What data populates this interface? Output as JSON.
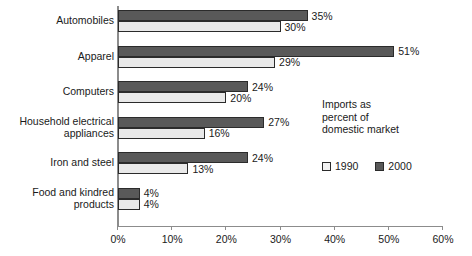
{
  "chart_data": {
    "type": "bar",
    "orientation": "horizontal",
    "title": "",
    "xlabel": "",
    "ylabel": "",
    "xlim": [
      0,
      60
    ],
    "xticks": [
      "0%",
      "10%",
      "20%",
      "30%",
      "40%",
      "50%",
      "60%"
    ],
    "xtick_values": [
      0,
      10,
      20,
      30,
      40,
      50,
      60
    ],
    "grid": false,
    "legend_position": "right-middle",
    "legend_title": "Imports as percent of domestic market",
    "legend_title_lines": [
      "Imports as",
      "percent of",
      "domestic market"
    ],
    "categories": [
      "Automobiles",
      "Apparel",
      "Computers",
      "Household electrical appliances",
      "Iron and steel",
      "Food and kindred products"
    ],
    "category_lines": [
      [
        "Automobiles"
      ],
      [
        "Apparel"
      ],
      [
        "Computers"
      ],
      [
        "Household electrical",
        "appliances"
      ],
      [
        "Iron and steel"
      ],
      [
        "Food and kindred",
        "products"
      ]
    ],
    "series": [
      {
        "name": "2000",
        "color": "#595959",
        "values": [
          35,
          51,
          24,
          27,
          24,
          4
        ],
        "labels": [
          "35%",
          "51%",
          "24%",
          "27%",
          "24%",
          "4%"
        ]
      },
      {
        "name": "1990",
        "color": "#e9e9e9",
        "values": [
          30,
          29,
          20,
          16,
          13,
          4
        ],
        "labels": [
          "30%",
          "29%",
          "20%",
          "16%",
          "13%",
          "4%"
        ]
      }
    ]
  },
  "legend": {
    "items": [
      {
        "label": "1990",
        "swatch_class": "s1990"
      },
      {
        "label": "2000",
        "swatch_class": "s2000"
      }
    ]
  }
}
